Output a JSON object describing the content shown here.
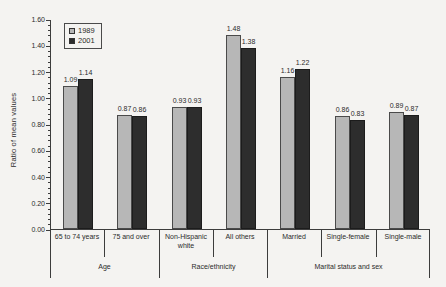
{
  "chart_data": {
    "type": "bar",
    "title": "",
    "ylabel": "Ratio of mean values",
    "xlabel": "",
    "ylim": [
      0,
      1.6
    ],
    "ytick_major": 0.2,
    "ytick_minor": 0.04,
    "ytick_decimals": 2,
    "grid": false,
    "legend_position": "inside-top-left",
    "value_labels_shown": true,
    "groups": [
      {
        "label": "Age",
        "categories": [
          "65 to 74 years",
          "75 and over"
        ]
      },
      {
        "label": "Race/ethnicity",
        "categories": [
          "Non-Hispanic white",
          "All others"
        ]
      },
      {
        "label": "Marital status and sex",
        "categories": [
          "Married",
          "Single-female",
          "Single-male"
        ]
      }
    ],
    "series": [
      {
        "name": "1989",
        "color": "#b7b7b7",
        "border_color": "#4a4a4a",
        "values": [
          1.09,
          0.87,
          0.93,
          1.48,
          1.16,
          0.86,
          0.89
        ]
      },
      {
        "name": "2001",
        "color": "#2d2d2d",
        "border_color": "#1c1c1c",
        "values": [
          1.14,
          0.86,
          0.93,
          1.38,
          1.22,
          0.83,
          0.87
        ]
      }
    ]
  },
  "colors": {
    "background": "#f4f3f1",
    "axis": "#3c3c3c",
    "text": "#2b2b2b"
  }
}
